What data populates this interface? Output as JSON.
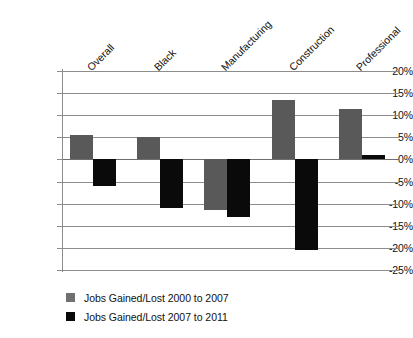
{
  "chart_data": {
    "type": "bar",
    "title": "",
    "subtitle": "",
    "xlabel": "",
    "ylabel": "",
    "ylim": [
      -25,
      20
    ],
    "ytick_step": 5,
    "grid": true,
    "legend_position": "bottom-left",
    "categories": [
      "Overall",
      "Black",
      "Manufacturing",
      "Construction",
      "Professional"
    ],
    "ytick_labels": [
      "20%",
      "15%",
      "10%",
      "5%",
      "0%",
      "-5%",
      "-10%",
      "-15%",
      "-20%",
      "-25%"
    ],
    "ytick_values": [
      20,
      15,
      10,
      5,
      0,
      -5,
      -10,
      -15,
      -20,
      -25
    ],
    "series": [
      {
        "name": "Jobs Gained/Lost 2000 to 2007",
        "color": "#595959",
        "values": [
          5.5,
          5.0,
          -11.5,
          13.5,
          11.5
        ]
      },
      {
        "name": "Jobs Gained/Lost 2007 to 2011",
        "color": "#0a0a0a",
        "values": [
          -6.0,
          -11.0,
          -13.0,
          -20.5,
          1.0
        ]
      }
    ]
  },
  "legend": {
    "items": [
      {
        "label": "Jobs Gained/Lost 2000 to 2007",
        "swatch": "series-a"
      },
      {
        "label": "Jobs Gained/Lost 2007 to 2011",
        "swatch": "series-b"
      }
    ]
  },
  "colors": {
    "series_a": "#595959",
    "series_b": "#0a0a0a",
    "gridline": "#8d8d8d",
    "background": "#ffffff",
    "text": "#111111"
  }
}
